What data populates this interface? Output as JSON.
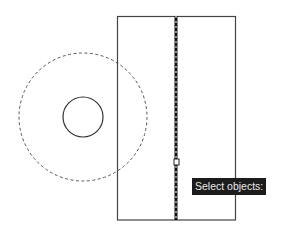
{
  "app": "CAD drawing area",
  "prompt": {
    "text": "Select objects:"
  },
  "drawing": {
    "rectangle": {
      "x": 117,
      "y": 16,
      "width": 118,
      "height": 204,
      "stroke": "#444444"
    },
    "center_line": {
      "x": 176,
      "y1": 16,
      "y2": 220,
      "style": "highlighted-dashed",
      "stroke": "#111111"
    },
    "outer_circle": {
      "cx": 83,
      "cy": 117,
      "r": 64,
      "style": "dashed",
      "stroke": "#555555"
    },
    "inner_circle": {
      "cx": 83,
      "cy": 117,
      "r": 20,
      "style": "solid",
      "stroke": "#333333"
    },
    "pickbox": {
      "x": 174,
      "y": 159,
      "size": 5
    }
  },
  "colors": {
    "background": "#ffffff",
    "tooltip_bg": "#1c1c1c",
    "tooltip_text": "#e8e8e8"
  }
}
